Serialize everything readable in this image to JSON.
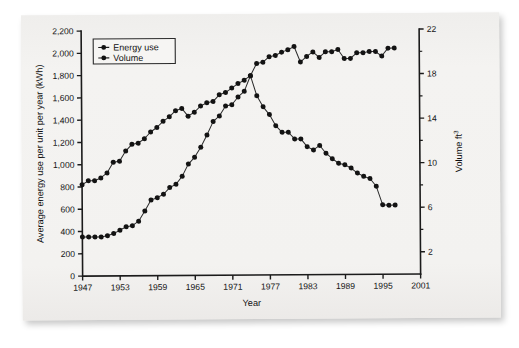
{
  "figure": {
    "background_color": "#f2f1ef",
    "ink_color": "#1b1b1b"
  },
  "chart_data": {
    "type": "line",
    "title": "",
    "xlabel": "Year",
    "ylabel": "Average energy use per unit per year (kWh)",
    "y2label": "Volume ft3",
    "y2label_base": "Volume ft",
    "y2label_exponent": "3",
    "xlim": [
      1947,
      2001
    ],
    "ylim": [
      0,
      2200
    ],
    "y2lim": [
      0,
      22
    ],
    "xticks": [
      1947,
      1953,
      1959,
      1965,
      1971,
      1977,
      1983,
      1989,
      1995,
      2001
    ],
    "xticklabels": [
      "1947",
      "1953",
      "1959",
      "1965",
      "1971",
      "1977",
      "1983",
      "1989",
      "1995",
      "2001"
    ],
    "yticks": [
      0,
      200,
      400,
      600,
      800,
      1000,
      1200,
      1400,
      1600,
      1800,
      2000,
      2200
    ],
    "yticklabels": [
      "0",
      "200",
      "400",
      "600",
      "800",
      "1,000",
      "1,200",
      "1,400",
      "1,600",
      "1,800",
      "2,000",
      "2,200"
    ],
    "y2ticks": [
      2,
      6,
      10,
      14,
      18,
      22
    ],
    "y2ticklabels": [
      "2",
      "6",
      "10",
      "14",
      "18",
      "22"
    ],
    "y2minorticks": [
      4,
      8,
      12,
      16,
      20
    ],
    "grid": false,
    "legend_position": "upper-left",
    "legend": [
      "Energy use",
      "Volume"
    ],
    "series": [
      {
        "name": "Energy use",
        "axis": "left",
        "marker": "circle",
        "x": [
          1947,
          1948,
          1949,
          1950,
          1951,
          1952,
          1953,
          1954,
          1955,
          1956,
          1957,
          1958,
          1959,
          1960,
          1961,
          1962,
          1963,
          1964,
          1965,
          1966,
          1967,
          1968,
          1969,
          1970,
          1971,
          1972,
          1973,
          1974,
          1975,
          1976,
          1977,
          1978,
          1979,
          1980,
          1981,
          1982,
          1983,
          1984,
          1985,
          1986,
          1987,
          1988,
          1989,
          1990,
          1991,
          1992,
          1993,
          1994,
          1995,
          1996,
          1997
        ],
        "y": [
          820,
          855,
          855,
          880,
          925,
          1020,
          1030,
          1120,
          1180,
          1190,
          1230,
          1290,
          1330,
          1385,
          1425,
          1480,
          1500,
          1430,
          1465,
          1520,
          1550,
          1560,
          1620,
          1640,
          1680,
          1720,
          1750,
          1790,
          1610,
          1510,
          1440,
          1340,
          1280,
          1280,
          1220,
          1220,
          1150,
          1120,
          1160,
          1090,
          1040,
          1000,
          985,
          955,
          910,
          880,
          860,
          790,
          625,
          620,
          620
        ]
      },
      {
        "name": "Volume",
        "axis": "right",
        "marker": "circle",
        "x": [
          1947,
          1948,
          1949,
          1950,
          1951,
          1952,
          1953,
          1954,
          1955,
          1956,
          1957,
          1958,
          1959,
          1960,
          1961,
          1962,
          1963,
          1964,
          1965,
          1966,
          1967,
          1968,
          1969,
          1970,
          1971,
          1972,
          1973,
          1974,
          1975,
          1976,
          1977,
          1978,
          1979,
          1980,
          1981,
          1982,
          1983,
          1984,
          1985,
          1986,
          1987,
          1988,
          1989,
          1990,
          1991,
          1992,
          1993,
          1994,
          1995,
          1996,
          1997
        ],
        "y": [
          3.5,
          3.5,
          3.5,
          3.5,
          3.6,
          3.8,
          4.1,
          4.4,
          4.5,
          4.9,
          5.8,
          6.8,
          7.0,
          7.3,
          7.9,
          8.2,
          8.9,
          10.0,
          10.6,
          11.5,
          12.6,
          13.8,
          14.3,
          15.2,
          15.3,
          16.0,
          16.5,
          17.9,
          19.0,
          19.1,
          19.6,
          19.7,
          20.0,
          20.2,
          20.5,
          19.1,
          19.6,
          20.0,
          19.5,
          20.0,
          20.0,
          20.2,
          19.4,
          19.4,
          19.9,
          19.9,
          20.0,
          20.0,
          19.6,
          20.3,
          20.3
        ]
      }
    ]
  }
}
